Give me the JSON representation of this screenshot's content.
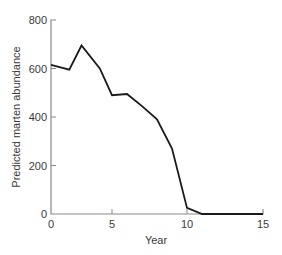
{
  "chart_data": {
    "type": "line",
    "title": "",
    "xlabel": "Year",
    "ylabel": "Predicted marten abundance",
    "xlim": [
      0,
      15
    ],
    "ylim": [
      0,
      800
    ],
    "x_ticks": [
      0,
      5,
      10,
      15
    ],
    "y_ticks": [
      0,
      200,
      400,
      600,
      800
    ],
    "grid": false,
    "legend": null,
    "series": [
      {
        "name": "Predicted marten abundance",
        "color": "#1a1a1a",
        "x": [
          0,
          1.5,
          2.5,
          4,
          5,
          6,
          7,
          8,
          9,
          10,
          11,
          15
        ],
        "values": [
          615,
          595,
          695,
          600,
          490,
          495,
          445,
          390,
          270,
          25,
          0,
          0
        ]
      }
    ]
  },
  "colors": {
    "axis": "#8a8a8a",
    "line": "#1a1a1a",
    "text": "#3a3a3a",
    "background": "#ffffff"
  }
}
